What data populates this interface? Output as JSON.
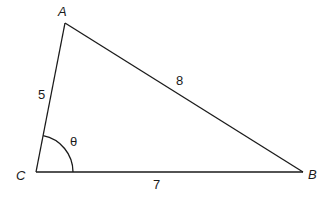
{
  "diagram": {
    "type": "triangle",
    "vertices": {
      "A": "A",
      "B": "B",
      "C": "C"
    },
    "sides": {
      "CA": "5",
      "AB": "8",
      "CB": "7"
    },
    "angle": {
      "vertex": "C",
      "label": "θ"
    },
    "colors": {
      "line": "#1a1a1a",
      "background": "#ffffff"
    }
  }
}
